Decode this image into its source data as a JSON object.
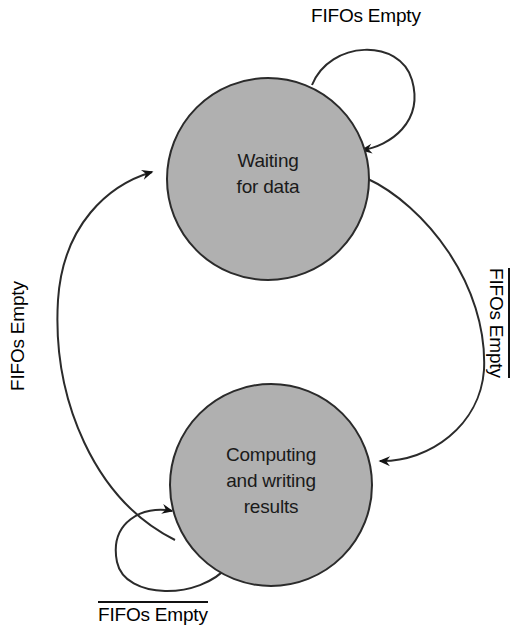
{
  "figure": {
    "type": "state-transition-diagram",
    "background_color": "#ffffff",
    "state_fill_color": "#b0b0b0",
    "stroke_color": "#2b2b2b",
    "text_color": "#1a1a1a"
  },
  "states": [
    {
      "id": "waiting",
      "lines": [
        "Waiting",
        "for data"
      ],
      "line1": "Waiting",
      "line2": "for data",
      "cx": 268,
      "cy": 179,
      "r": 101
    },
    {
      "id": "computing",
      "lines": [
        "Computing",
        "and writing",
        "results"
      ],
      "line1": "Computing",
      "line2": "and writing",
      "line3": "results",
      "cx": 271,
      "cy": 485,
      "r": 101
    }
  ],
  "transitions": [
    {
      "id": "waiting-self-loop",
      "label": "FIFOs Empty",
      "negated": false,
      "from": "waiting",
      "to": "waiting",
      "label_position": "top"
    },
    {
      "id": "waiting-to-computing",
      "label": "FIFOs Empty",
      "negated": true,
      "from": "waiting",
      "to": "computing",
      "label_position": "right",
      "label_rotation": "clockwise"
    },
    {
      "id": "computing-self-loop",
      "label": "FIFOs Empty",
      "negated": true,
      "from": "computing",
      "to": "computing",
      "label_position": "bottom"
    },
    {
      "id": "computing-to-waiting",
      "label": "FIFOs Empty",
      "negated": false,
      "from": "computing",
      "to": "waiting",
      "label_position": "left",
      "label_rotation": "counter-clockwise"
    }
  ]
}
